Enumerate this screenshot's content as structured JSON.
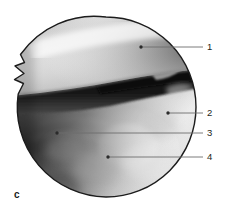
{
  "figure": {
    "panel_letter": "c",
    "background_color": "#ffffff",
    "viewport": {
      "shape": "circle",
      "center_x": 106,
      "center_y": 107,
      "radius": 90,
      "border_color": "#1c1c1c",
      "notch_present": true,
      "notch_description": "zigzag notch artifact on left edge of arthroscopic circular field of view"
    },
    "image_description": "arthroscopic view: bright smooth cartilage surface upper field, dark shadowed cleft across middle, fibrous textured tissue lower field",
    "callouts": [
      {
        "number": "1",
        "label_x": 207,
        "label_y": 42,
        "dot_x": 141,
        "dot_y": 47,
        "line_end_x": 203,
        "line_y": 47
      },
      {
        "number": "2",
        "label_x": 207,
        "label_y": 108,
        "dot_x": 168,
        "dot_y": 113,
        "line_end_x": 203,
        "line_y": 113
      },
      {
        "number": "3",
        "label_x": 207,
        "label_y": 128,
        "dot_x": 57,
        "dot_y": 133,
        "line_end_x": 203,
        "line_y": 133
      },
      {
        "number": "4",
        "label_x": 207,
        "label_y": 152,
        "dot_x": 108,
        "dot_y": 157,
        "line_end_x": 203,
        "line_y": 157
      }
    ],
    "leader_line_color": "#6e6e6e",
    "leader_dot_color": "#2b2b2b",
    "label_text_color": "#231f20"
  }
}
